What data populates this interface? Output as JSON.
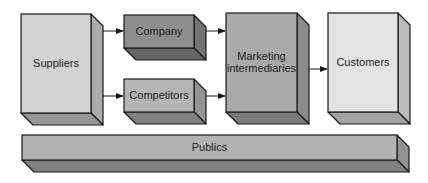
{
  "diagram": {
    "type": "flow",
    "nodes": [
      {
        "id": "suppliers",
        "label": "Suppliers",
        "lines": [
          "Suppliers"
        ],
        "x": 21,
        "y": 14,
        "w": 70,
        "h": 99,
        "color": "#d2d2d2"
      },
      {
        "id": "company",
        "label": "Company",
        "lines": [
          "Company"
        ],
        "x": 124,
        "y": 15,
        "w": 70,
        "h": 33,
        "color": "#8e8e8e"
      },
      {
        "id": "competitors",
        "label": "Competitors",
        "lines": [
          "Competitors"
        ],
        "x": 124,
        "y": 79,
        "w": 70,
        "h": 33,
        "color": "#b5b5b5"
      },
      {
        "id": "marketing-intermediaries",
        "label": "Marketing intermediaries",
        "lines": [
          "Marketing",
          "intermediaries"
        ],
        "x": 226,
        "y": 13,
        "w": 71,
        "h": 99,
        "color": "#a9a9a9"
      },
      {
        "id": "customers",
        "label": "Customers",
        "lines": [
          "Customers"
        ],
        "x": 328,
        "y": 13,
        "w": 70,
        "h": 99,
        "color": "#e3e3e3"
      },
      {
        "id": "publics",
        "label": "Publics",
        "lines": [
          "Publics"
        ],
        "x": 22,
        "y": 135,
        "w": 375,
        "h": 25,
        "color": "#b2b2b2"
      }
    ],
    "edges": [
      {
        "from": "suppliers",
        "to": "company",
        "y": 31
      },
      {
        "from": "suppliers",
        "to": "competitors",
        "y": 96
      },
      {
        "from": "company",
        "to": "marketing-intermediaries",
        "y": 31
      },
      {
        "from": "competitors",
        "to": "marketing-intermediaries",
        "y": 96
      },
      {
        "from": "marketing-intermediaries",
        "to": "customers",
        "y": 69
      }
    ],
    "depth": 12,
    "stroke": "#1a1a1a"
  }
}
